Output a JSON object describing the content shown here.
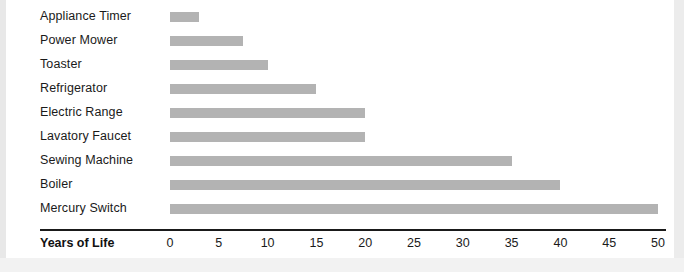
{
  "chart_data": {
    "type": "bar",
    "orientation": "horizontal",
    "title": "",
    "subtitle": "",
    "xlabel": "Years of Life",
    "ylabel": "",
    "xlim": [
      0,
      50
    ],
    "xticks": [
      0,
      5,
      10,
      15,
      20,
      25,
      30,
      35,
      40,
      45,
      50
    ],
    "grid": false,
    "legend": null,
    "bar_color": "#b3b3b3",
    "axis_color": "#1a1a1a",
    "categories": [
      "Appliance Timer",
      "Power Mower",
      "Toaster",
      "Refrigerator",
      "Electric Range",
      "Lavatory Faucet",
      "Sewing Machine",
      "Boiler",
      "Mercury Switch"
    ],
    "values": [
      3,
      7.5,
      10,
      15,
      20,
      20,
      35,
      40,
      50
    ]
  }
}
